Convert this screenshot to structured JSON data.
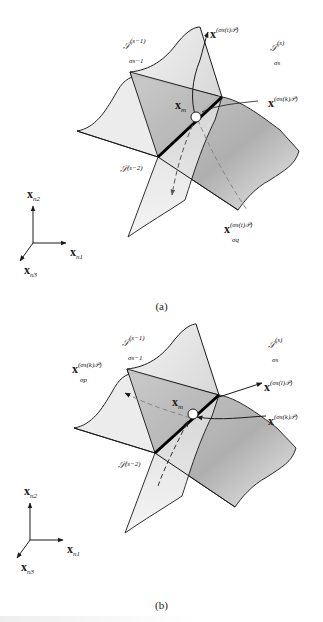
{
  "figure": {
    "panels": [
      {
        "id": "a",
        "caption": "(a)",
        "labels": {
          "surface_prev": {
            "base": "𝒮",
            "sup": "(s−1)",
            "sub": "σs−1"
          },
          "surface_curr": {
            "base": "𝒮",
            "sup": "(s)",
            "sub": "σs"
          },
          "surface_prev2": {
            "base": "𝒮",
            "sup": "(s−2)"
          },
          "point_m": {
            "base": "x",
            "sub": "m"
          },
          "vec_top": {
            "base": "x",
            "sup": "(σs(t)𝒫)"
          },
          "vec_right": {
            "base": "x",
            "sup": "(σs(k)𝒫)"
          },
          "vec_bottom": {
            "base": "x",
            "sup": "(σs(t)𝒫)",
            "sub": "σq"
          }
        }
      },
      {
        "id": "b",
        "caption": "(b)",
        "labels": {
          "surface_prev": {
            "base": "𝒮",
            "sup": "(s−1)",
            "sub": "σs−1"
          },
          "surface_curr": {
            "base": "𝒮",
            "sup": "(s)",
            "sub": "σs"
          },
          "surface_prev2": {
            "base": "𝒮",
            "sup": "(s−2)"
          },
          "point_m": {
            "base": "x",
            "sub": "m"
          },
          "vec_left": {
            "base": "x",
            "sup": "(σs(k)𝒫)",
            "sub": "σp"
          },
          "vec_right_top": {
            "base": "x",
            "sup": "(σs(l)𝒫)"
          },
          "vec_right_bottom": {
            "base": "x",
            "sup": "(σs(k)𝒫)"
          }
        }
      }
    ],
    "axes": {
      "n1": {
        "base": "x",
        "sub": "n1"
      },
      "n2": {
        "base": "x",
        "sub": "n2"
      },
      "n3": {
        "base": "x",
        "sub": "n3"
      }
    },
    "colors": {
      "line": "#1a1a1a",
      "surface_light": "#e8e8e8",
      "surface_dark": "#9a9a9a",
      "dashed": "#666666"
    }
  }
}
